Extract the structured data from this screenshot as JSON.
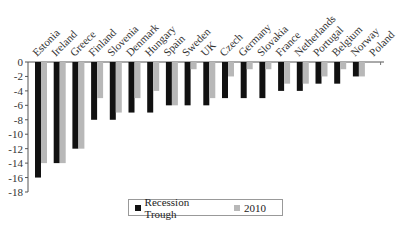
{
  "chart_data": {
    "type": "bar",
    "title": "",
    "xlabel": "",
    "ylabel": "",
    "ylim": [
      -18,
      0
    ],
    "yticks": [
      0,
      -2,
      -4,
      -6,
      -8,
      -10,
      -12,
      -14,
      -16,
      -18
    ],
    "grid": false,
    "legend_position": "bottom",
    "categories": [
      "Estonia",
      "Ireland",
      "Greece",
      "Finland",
      "Slovenia",
      "Denmark",
      "Hungary",
      "Spain",
      "Sweden",
      "UK",
      "Czech",
      "Germany",
      "Slovakia",
      "France",
      "Netherlands",
      "Portugal",
      "Belgium",
      "Norway",
      "Poland"
    ],
    "series": [
      {
        "name": "Recession Trough",
        "color": "#111111",
        "values": [
          -16,
          -14,
          -12,
          -8,
          -8,
          -7,
          -7,
          -6,
          -6,
          -6,
          -5,
          -5,
          -5,
          -4,
          -4,
          -3,
          -3,
          -2,
          0
        ]
      },
      {
        "name": "2010",
        "color": "#b8b8b8",
        "values": [
          -14,
          -14,
          -12,
          -5,
          -7,
          -5,
          -4,
          -6,
          -1,
          -5,
          -2,
          -1,
          -1,
          -3,
          -3,
          -2,
          -1,
          -2,
          0
        ]
      }
    ]
  },
  "legend": {
    "items": [
      {
        "label": "Recession Trough",
        "color": "#111111"
      },
      {
        "label": "2010",
        "color": "#b8b8b8"
      }
    ]
  }
}
